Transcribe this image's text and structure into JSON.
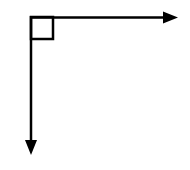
{
  "diagram": {
    "type": "right-angle-axes",
    "colors": {
      "stroke": "#000000",
      "background": "#ffffff"
    },
    "origin": {
      "x": 31,
      "y": 17
    },
    "horizontal_arrow": {
      "x1": 31,
      "y1": 17,
      "x2": 178,
      "y2": 18,
      "direction": "right"
    },
    "vertical_arrow": {
      "x1": 31,
      "y1": 17,
      "x2": 31,
      "y2": 155,
      "direction": "down"
    },
    "right_angle_marker": {
      "x": 31,
      "y": 17,
      "size": 22
    },
    "stroke_width": 2.5
  }
}
